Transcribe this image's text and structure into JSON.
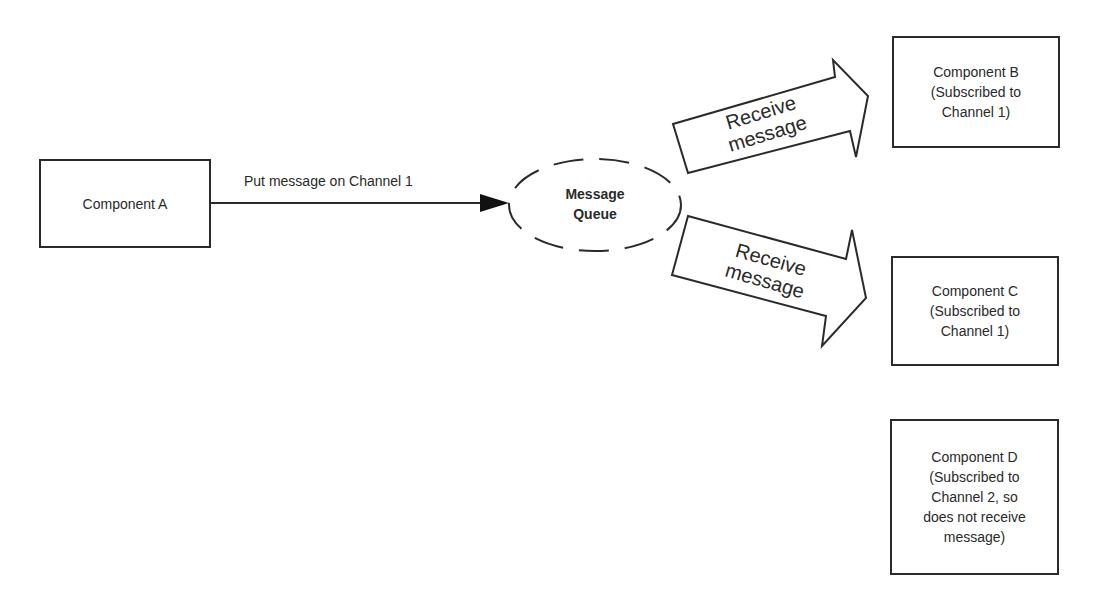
{
  "diagram": {
    "type": "publish-subscribe message queue",
    "colors": {
      "stroke": "#2a2a2a",
      "background": "#ffffff",
      "text": "#2a2a2a"
    },
    "publisher": {
      "label": "Component A"
    },
    "publish_edge": {
      "label": "Put message on Channel 1"
    },
    "queue": {
      "label": "Message\nQueue"
    },
    "receive_arrows": [
      {
        "label": "Receive\nmessage",
        "target": "Component B"
      },
      {
        "label": "Receive\nmessage",
        "target": "Component C"
      }
    ],
    "subscribers": [
      {
        "label": "Component B\n(Subscribed to\nChannel 1)"
      },
      {
        "label": "Component C\n(Subscribed to\nChannel 1)"
      },
      {
        "label": "Component D\n(Subscribed to\nChannel 2, so\ndoes not receive\nmessage)"
      }
    ]
  }
}
